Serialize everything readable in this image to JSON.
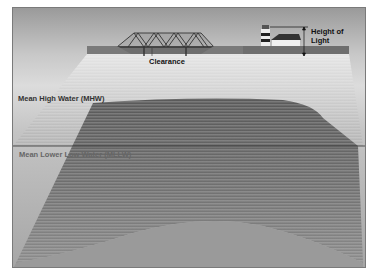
{
  "diagram": {
    "labels": {
      "clearance": "Clearance",
      "height_of_light_line1": "Height of",
      "height_of_light_line2": "Light",
      "mhw": "Mean High Water (MHW)",
      "mllw": "Mean Lower Low Water (MLLW)"
    },
    "elements": [
      "bridge",
      "lighthouse",
      "house",
      "shoreline",
      "water-surface-MHW",
      "datum-line-MLLW",
      "seafloor"
    ],
    "colors": {
      "background_top": "#9a9a9a",
      "water_dark": "#5e5e5e",
      "seafloor": "#8c8c8c",
      "line": "#222222"
    }
  }
}
